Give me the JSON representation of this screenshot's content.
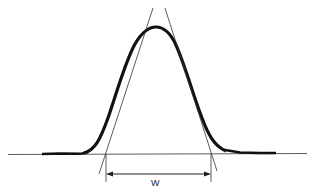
{
  "diagram": {
    "width_label": "W",
    "colors": {
      "ink": "#1a1a1a",
      "background": "#ffffff"
    }
  }
}
